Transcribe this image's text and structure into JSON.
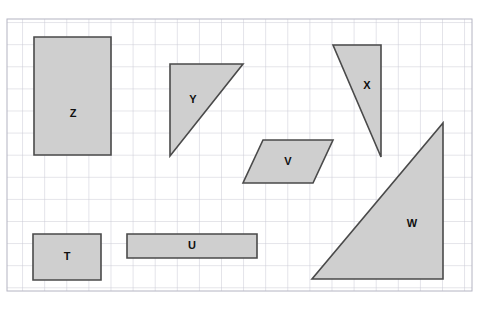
{
  "page": {
    "top_caption": "",
    "background_color": "#ffffff"
  },
  "grid": {
    "x": 7,
    "y": 19,
    "width": 465,
    "height": 272,
    "cell_size": 22.1,
    "line_color": "#c9c9d4",
    "border_color": "#b4b4c2",
    "label": "square-grid"
  },
  "style": {
    "shape_fill": "#cfcfcf",
    "shape_stroke": "#4a4a4a",
    "shape_stroke_width": 1.6,
    "label_color": "#101010"
  },
  "shapes": [
    {
      "id": "Z",
      "label": "Z",
      "type": "rectangle",
      "points": "34,37 111,37 111,155 34,155",
      "label_x": 73,
      "label_y": 114
    },
    {
      "id": "Y",
      "label": "Y",
      "type": "right-triangle",
      "points": "170,64 243,64 170,156",
      "label_x": 193,
      "label_y": 100
    },
    {
      "id": "X",
      "label": "X",
      "type": "triangle",
      "points": "333,45 381,45 381,157",
      "label_x": 367,
      "label_y": 86
    },
    {
      "id": "V",
      "label": "V",
      "type": "parallelogram",
      "points": "263,140 333,140 313,183 243,183",
      "label_x": 288,
      "label_y": 162
    },
    {
      "id": "W",
      "label": "W",
      "type": "right-triangle",
      "points": "443,123 443,279 312,279",
      "label_x": 412,
      "label_y": 224
    },
    {
      "id": "T",
      "label": "T",
      "type": "rectangle",
      "points": "33,234 101,234 101,280 33,280",
      "label_x": 67,
      "label_y": 257
    },
    {
      "id": "U",
      "label": "U",
      "type": "rectangle",
      "points": "127,234 257,234 257,258 127,258",
      "label_x": 192,
      "label_y": 246
    }
  ]
}
